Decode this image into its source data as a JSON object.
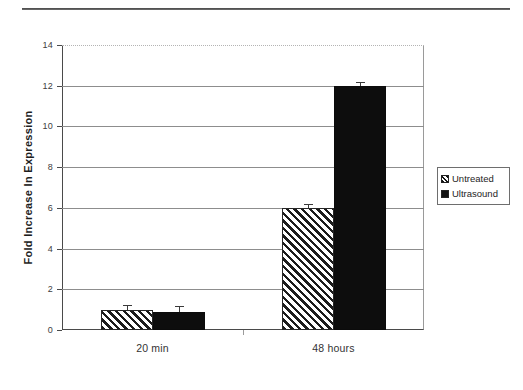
{
  "figure": {
    "background_color": "#ffffff",
    "top_rule_color": "#3a3a3a"
  },
  "axis": {
    "ylabel": "Fold Increase In Expression",
    "ytick_labels": [
      "0",
      "2",
      "4",
      "6",
      "8",
      "10",
      "12",
      "14"
    ],
    "xtick_labels": [
      "20 min",
      "48 hours"
    ]
  },
  "legend": {
    "items": [
      {
        "label": "Untreated",
        "swatch": "hatched-swatch",
        "color": "#1c1c1c"
      },
      {
        "label": "Ultrasound",
        "swatch": "solid-black-swatch",
        "color": "#0d0d0d"
      }
    ]
  },
  "chart_data": {
    "type": "bar",
    "title": "",
    "xlabel": "",
    "ylabel": "Fold Increase In Expression",
    "categories": [
      "20 min",
      "48 hours"
    ],
    "series": [
      {
        "name": "Untreated",
        "values": [
          1.0,
          6.0
        ],
        "errors": [
          0.25,
          0.2
        ],
        "fill": "hatched",
        "color": "#1c1c1c"
      },
      {
        "name": "Ultrasound",
        "values": [
          0.9,
          12.0
        ],
        "errors": [
          0.3,
          0.2
        ],
        "fill": "solid",
        "color": "#0d0d0d"
      }
    ],
    "ylim": [
      0,
      14
    ],
    "ytick_step": 2,
    "grid": true,
    "grid_axis": "y",
    "legend_position": "right"
  }
}
